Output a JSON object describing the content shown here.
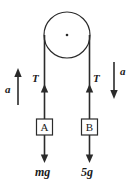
{
  "diagram": {
    "background_color": "#ffffff",
    "stroke_color": "#2b2b2b",
    "text_color": "#1a1a1a",
    "pulley": {
      "label": "",
      "center_dot": "·",
      "cx": 67,
      "cy": 35,
      "r": 23
    },
    "left_side": {
      "tension_label": "T",
      "acceleration_label": "a",
      "acceleration_direction": "up",
      "block_label": "A",
      "weight_label": "mg"
    },
    "right_side": {
      "tension_label": "T",
      "acceleration_label": "a",
      "acceleration_direction": "down",
      "block_label": "B",
      "weight_label": "5g"
    }
  }
}
